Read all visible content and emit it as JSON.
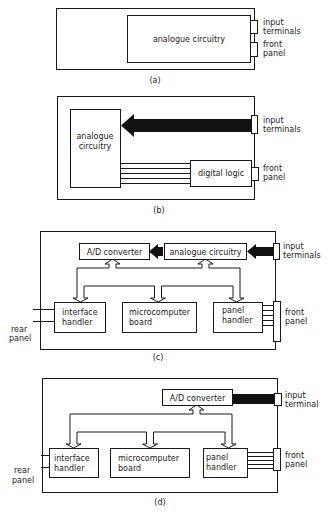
{
  "colors": {
    "ink": "#1a1a1a",
    "background": "#ffffff",
    "signal_arrow": "#111111"
  },
  "panels": {
    "a": {
      "caption": "(a)",
      "blocks": {
        "analogue": "analogue circuitry"
      },
      "connectors": {
        "input_1": "input",
        "input_2": "terminals",
        "front_1": "front",
        "front_2": "panel"
      }
    },
    "b": {
      "caption": "(b)",
      "blocks": {
        "analogue_1": "analogue",
        "analogue_2": "circuitry",
        "digital": "digital logic"
      },
      "connectors": {
        "input_1": "input",
        "input_2": "terminals",
        "front_1": "front",
        "front_2": "panel"
      }
    },
    "c": {
      "caption": "(c)",
      "blocks": {
        "adc": "A/D converter",
        "analogue": "analogue circuitry",
        "interface_1": "interface",
        "interface_2": "handler",
        "micro_1": "microcomputer",
        "micro_2": "board",
        "panel_1": "panel",
        "panel_2": "handler"
      },
      "connectors": {
        "input_1": "input",
        "input_2": "terminals",
        "front_1": "front",
        "front_2": "panel",
        "rear_1": "rear",
        "rear_2": "panel"
      }
    },
    "d": {
      "caption": "(d)",
      "blocks": {
        "adc": "A/D converter",
        "interface_1": "interface",
        "interface_2": "handler",
        "micro_1": "microcomputer",
        "micro_2": "board",
        "panel_1": "panel",
        "panel_2": "handler"
      },
      "connectors": {
        "input_1": "input",
        "input_2": "terminal",
        "front_1": "front",
        "front_2": "panel",
        "rear_1": "rear",
        "rear_2": "panel"
      }
    }
  }
}
